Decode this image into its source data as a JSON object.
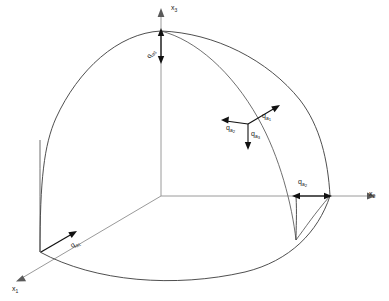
{
  "figure": {
    "name": "spherical-octant-vector-diagram",
    "background_color": "#ffffff",
    "axis_color": "#9a9a9a",
    "curve_color": "#3b3b3b",
    "vector_color": "#111111"
  },
  "axes": {
    "x1": {
      "label_base": "x",
      "label_sub": "1"
    },
    "x2": {
      "label_base": "x",
      "label_sub": "2"
    },
    "x3": {
      "label_base": "x",
      "label_sub": "3"
    }
  },
  "component_labels": {
    "qa1": {
      "base": "q",
      "sub": "a",
      "sub2": "1"
    },
    "qa2": {
      "base": "q",
      "sub": "a",
      "sub2": "2"
    },
    "qa3": {
      "base": "q",
      "sub": "a",
      "sub2": "3"
    }
  },
  "triad_labels": {
    "qa1": {
      "base": "q",
      "sub": "a",
      "sub2": "1"
    },
    "qa2": {
      "base": "q",
      "sub": "a",
      "sub2": "2"
    },
    "qa3": {
      "base": "q",
      "sub": "a",
      "sub2": "3"
    }
  }
}
